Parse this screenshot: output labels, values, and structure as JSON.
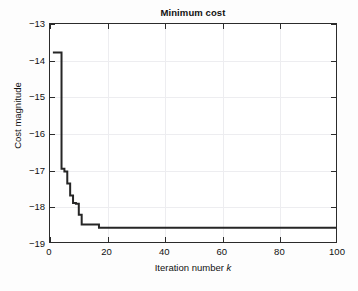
{
  "chart_data": {
    "type": "line",
    "title": "Minimum cost",
    "xlabel": "Iteration number k",
    "ylabel": "Cost magnitude",
    "xlim": [
      0,
      100
    ],
    "ylim": [
      -19,
      -13
    ],
    "xticks": [
      0,
      20,
      40,
      60,
      80,
      100
    ],
    "yticks": [
      -13,
      -14,
      -15,
      -16,
      -17,
      -18,
      -19
    ],
    "xtick_labels": [
      "0",
      "20",
      "40",
      "60",
      "80",
      "100"
    ],
    "ytick_labels": [
      "-13",
      "-14",
      "-15",
      "-16",
      "-17",
      "-18",
      "-19"
    ],
    "grid": true,
    "legend": null,
    "line_color": "#262626",
    "line_width": 2,
    "series": [
      {
        "name": "minimum cost",
        "x": [
          1,
          2,
          3,
          4,
          5,
          6,
          7,
          8,
          9,
          10,
          11,
          12,
          13,
          14,
          15,
          16,
          17,
          18,
          19,
          20,
          25,
          30,
          35,
          40,
          45,
          50,
          55,
          60,
          65,
          70,
          75,
          80,
          85,
          90,
          95,
          100
        ],
        "values": [
          -13.78,
          -13.78,
          -13.78,
          -16.95,
          -17.02,
          -17.35,
          -17.68,
          -17.88,
          -17.9,
          -18.2,
          -18.47,
          -18.47,
          -18.47,
          -18.47,
          -18.47,
          -18.47,
          -18.56,
          -18.56,
          -18.56,
          -18.56,
          -18.56,
          -18.56,
          -18.56,
          -18.56,
          -18.56,
          -18.56,
          -18.56,
          -18.56,
          -18.56,
          -18.56,
          -18.56,
          -18.56,
          -18.56,
          -18.56,
          -18.56,
          -18.56
        ]
      }
    ],
    "annotations": {
      "initial_value": "-13.78",
      "converged_value": "-18.56",
      "convergence_iteration": "17"
    }
  },
  "figure": {
    "background_color": "#fdfdfd",
    "axes_color": "#2b2b2b",
    "grid_color": "#ededf0"
  }
}
